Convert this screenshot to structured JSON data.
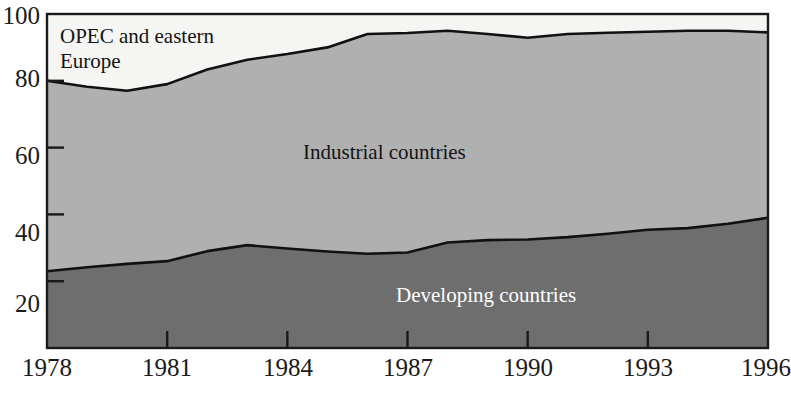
{
  "chart_data": {
    "type": "area",
    "title": "",
    "subtitle": "",
    "xlabel": "",
    "ylabel": "",
    "stacked": true,
    "grid": false,
    "legend_position": "inline-annotations",
    "xlim": [
      1978,
      1996
    ],
    "ylim": [
      0,
      100
    ],
    "x": [
      1978,
      1979,
      1980,
      1981,
      1982,
      1983,
      1984,
      1985,
      1986,
      1987,
      1988,
      1989,
      1990,
      1991,
      1992,
      1993,
      1994,
      1995,
      1996
    ],
    "xticks": [
      1978,
      1981,
      1984,
      1987,
      1990,
      1993,
      1996
    ],
    "xtick_labels": [
      "1978",
      "1981",
      "1984",
      "1987",
      "1990",
      "1993",
      "1996"
    ],
    "yticks": [
      20,
      40,
      60,
      80,
      100
    ],
    "ytick_labels": [
      "20",
      "40",
      "60",
      "80",
      "100"
    ],
    "series": [
      {
        "name": "Developing countries",
        "color": "#6e6e6e",
        "values": [
          23.0,
          24.2,
          25.2,
          26.0,
          29.0,
          30.8,
          29.8,
          28.9,
          28.2,
          28.6,
          31.6,
          32.3,
          32.5,
          33.2,
          34.2,
          35.4,
          35.9,
          37.2,
          39.0
        ]
      },
      {
        "name": "Industrial countries",
        "color": "#b0b0b0",
        "values": [
          57.0,
          54.0,
          51.8,
          53.0,
          54.4,
          55.5,
          58.2,
          61.1,
          65.8,
          65.7,
          63.4,
          61.7,
          60.4,
          60.8,
          60.2,
          59.3,
          59.1,
          57.8,
          55.5
        ]
      },
      {
        "name": "OPEC and eastern Europe",
        "color": "#f5f5f3",
        "values": [
          20.0,
          21.8,
          23.0,
          21.0,
          16.6,
          13.7,
          12.0,
          10.0,
          6.0,
          5.7,
          5.0,
          6.0,
          7.1,
          6.0,
          5.6,
          5.3,
          5.0,
          5.0,
          5.5
        ]
      }
    ],
    "cumulative_upper_boundaries": {
      "developing": [
        23.0,
        24.2,
        25.2,
        26.0,
        29.0,
        30.8,
        29.8,
        28.9,
        28.2,
        28.6,
        31.6,
        32.3,
        32.5,
        33.2,
        34.2,
        35.4,
        35.9,
        37.2,
        39.0
      ],
      "developing_plus_industrial": [
        80.0,
        78.2,
        77.0,
        79.0,
        83.4,
        86.3,
        88.0,
        90.0,
        94.0,
        94.3,
        95.0,
        94.0,
        92.9,
        94.0,
        94.4,
        94.7,
        95.0,
        95.0,
        94.5
      ]
    },
    "annotations": [
      {
        "id": "opec",
        "text": "OPEC and eastern\nEurope",
        "color": "#141414"
      },
      {
        "id": "industrial",
        "text": "Industrial countries",
        "color": "#141414"
      },
      {
        "id": "developing",
        "text": "Developing countries",
        "color": "#ffffff"
      }
    ]
  },
  "axis": {
    "frame_color": "#1a1a1a",
    "tick_color": "#1a1a1a"
  }
}
